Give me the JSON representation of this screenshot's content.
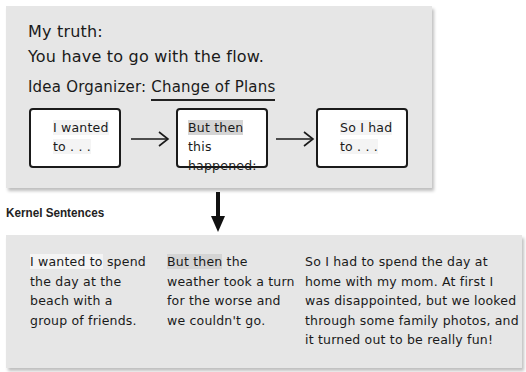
{
  "organizer": {
    "truth_label": "My truth:",
    "truth_text": "You have to go with the flow.",
    "organizer_label": "Idea Organizer:",
    "organizer_name": "Change of Plans",
    "boxes": [
      {
        "highlight": "I wanted",
        "rest": "",
        "line2": "to . . ."
      },
      {
        "highlight": "But then",
        "rest": " this",
        "line2": "happened:"
      },
      {
        "highlight": "",
        "rest": "So I had",
        "line2": "to . . ."
      }
    ]
  },
  "kernel": {
    "heading": "Kernel Sentences",
    "sentences": [
      {
        "highlight": "I wanted to",
        "rest": " spend the day at the beach with a group of friends."
      },
      {
        "highlight": "But then",
        "rest": " the weather took a turn for the worse and we couldn't go."
      },
      {
        "highlight": "",
        "rest": "So I had to spend the day at home with my mom. At first I was disappointed, but we looked through some family photos, and it turned out to be really fun!"
      }
    ]
  },
  "colors": {
    "panel_bg": "#e6e6e6",
    "highlight": "#d4d4d4",
    "ink": "#1a1a1a"
  }
}
